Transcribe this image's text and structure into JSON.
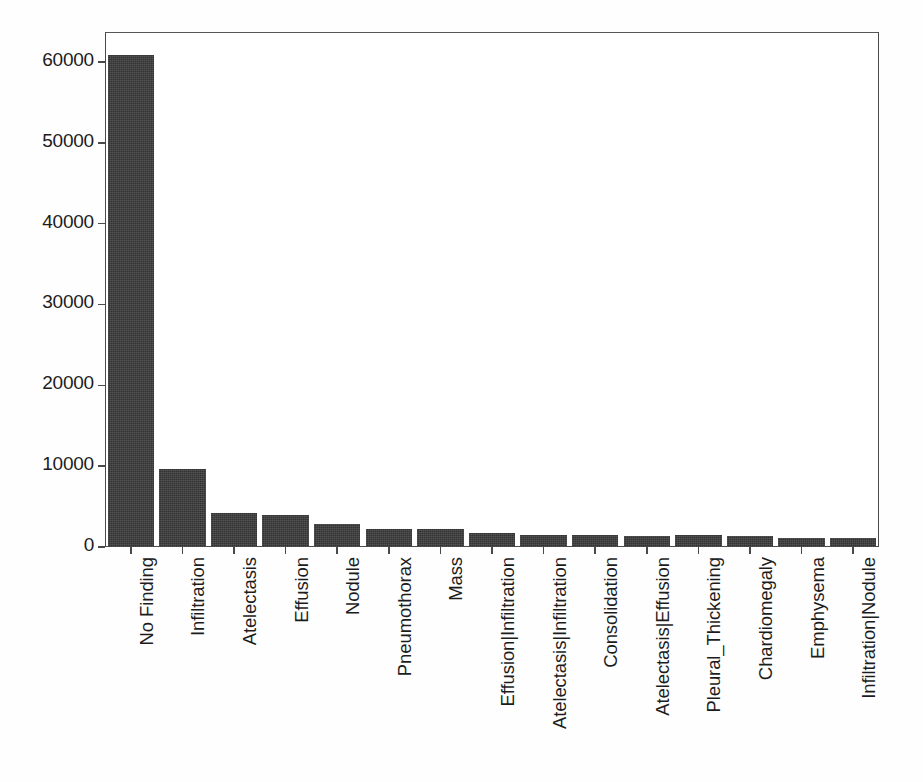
{
  "chart_data": {
    "type": "bar",
    "title": "",
    "subtitle": "",
    "xlabel": "",
    "ylabel": "",
    "grid": false,
    "legend": null,
    "orientation": "vertical",
    "bar_color": "#3a3a3a",
    "axis_color": "#4a4a4a",
    "background": "#ffffff",
    "xlim": [
      0,
      15
    ],
    "ylim": [
      0,
      63700
    ],
    "ytick_labels": [
      "60000",
      "50000",
      "40000",
      "30000",
      "20000",
      "10000",
      "0"
    ],
    "ytick_values": [
      60000,
      50000,
      40000,
      30000,
      20000,
      10000,
      0
    ],
    "xtick_rotation": 90,
    "categories": [
      "No Finding",
      "Infiltration",
      "Atelectasis",
      "Effusion",
      "Nodule",
      "Pneumothorax",
      "Mass",
      "Effusion|Infiltration",
      "Atelectasis|Infiltration",
      "Consolidation",
      "Atelectasis|Effusion",
      "Pleural_Thickening",
      "Chardiomegaly",
      "Emphysema",
      "Infiltration|Nodule"
    ],
    "values": [
      60800,
      9650,
      4200,
      4000,
      2850,
      2250,
      2230,
      1730,
      1480,
      1480,
      1400,
      1430,
      1400,
      1120,
      1100
    ]
  }
}
